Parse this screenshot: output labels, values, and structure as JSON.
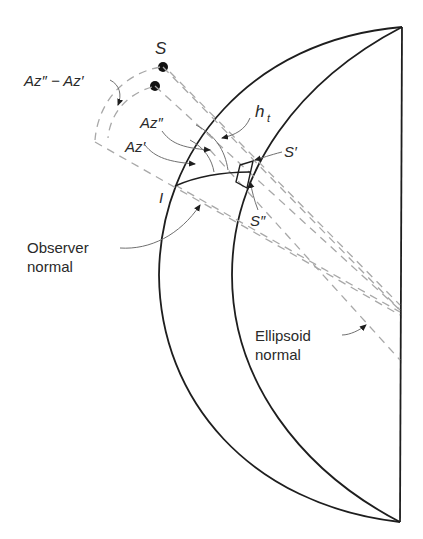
{
  "figure": {
    "labels": {
      "star": "S",
      "az_diff": "Az″ − Az′",
      "az_double": "Az″",
      "az_single": "Az′",
      "height": "h",
      "height_sub": "t",
      "s_prime": "S′",
      "s_double": "S″",
      "observer_point": "I",
      "observer_normal_1": "Observer",
      "observer_normal_2": "normal",
      "ellipsoid_normal_1": "Ellipsoid",
      "ellipsoid_normal_2": "normal"
    },
    "colors": {
      "line": "#1e1e1e",
      "dashed": "#a8a8a8",
      "text": "#2a2a2a"
    }
  }
}
